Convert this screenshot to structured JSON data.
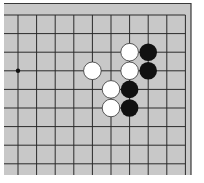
{
  "board": {
    "background": "#c8c8c8",
    "line_color": "#2a2a2a",
    "frame_color": "#3a3a3a",
    "area": {
      "x": 4,
      "y": 3,
      "w": 187,
      "h": 172
    },
    "grid": {
      "origin_x": 18,
      "origin_y": 15,
      "spacing": 18.6,
      "cols": 10,
      "rows": 9,
      "open_left": true,
      "open_bottom": true,
      "top_edge": true,
      "right_edge": true
    },
    "star_points": [
      {
        "col": 0,
        "row": 3
      }
    ],
    "stones": [
      {
        "color": "white",
        "col": 6,
        "row": 2
      },
      {
        "color": "black",
        "col": 7,
        "row": 2
      },
      {
        "color": "white",
        "col": 4,
        "row": 3
      },
      {
        "color": "white",
        "col": 6,
        "row": 3
      },
      {
        "color": "black",
        "col": 7,
        "row": 3
      },
      {
        "color": "white",
        "col": 5,
        "row": 4
      },
      {
        "color": "black",
        "col": 6,
        "row": 4
      },
      {
        "color": "white",
        "col": 5,
        "row": 5
      },
      {
        "color": "black",
        "col": 6,
        "row": 5
      }
    ],
    "stone_colors": {
      "black": "#111111",
      "white": "#ffffff",
      "white_outline": "#333333"
    }
  }
}
